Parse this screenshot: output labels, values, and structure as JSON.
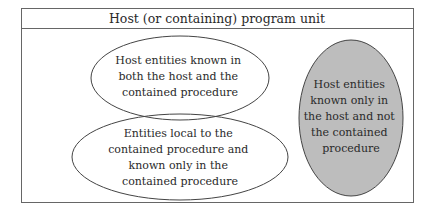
{
  "diagram": {
    "title": "Host (or containing) program unit",
    "regions": [
      {
        "id": "shared",
        "lines": [
          "Host entities known in",
          "both the host and the",
          "contained procedure"
        ],
        "fill": "#ffffff"
      },
      {
        "id": "local",
        "lines": [
          "Entities local to the",
          "contained procedure and",
          "known only in the",
          "contained procedure"
        ],
        "fill": "#ffffff"
      },
      {
        "id": "host-only",
        "lines": [
          "Host entities",
          "known only in",
          "the host and not",
          "the contained",
          "procedure"
        ],
        "fill": "#bdbdbd"
      }
    ],
    "colors": {
      "stroke": "#444444",
      "box_stroke": "#666666",
      "grey_fill": "#bdbdbd"
    }
  }
}
